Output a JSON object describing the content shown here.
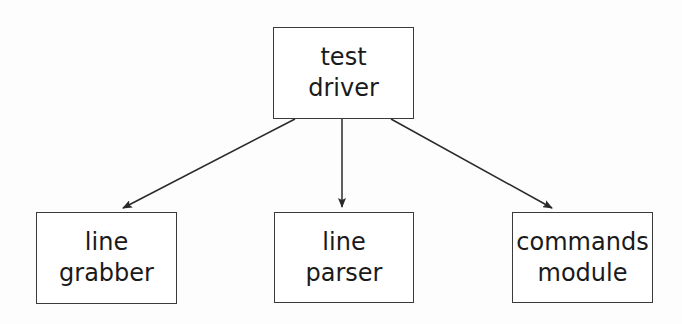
{
  "diagram": {
    "type": "hierarchy",
    "nodes": [
      {
        "id": "test-driver",
        "lines": [
          "test",
          "driver"
        ],
        "box": {
          "x": 273,
          "y": 27,
          "w": 141,
          "h": 92
        }
      },
      {
        "id": "line-grabber",
        "lines": [
          "line",
          "grabber"
        ],
        "box": {
          "x": 36,
          "y": 212,
          "w": 141,
          "h": 92
        }
      },
      {
        "id": "line-parser",
        "lines": [
          "line",
          "parser"
        ],
        "box": {
          "x": 274,
          "y": 212,
          "w": 140,
          "h": 91
        }
      },
      {
        "id": "commands-module",
        "lines": [
          "commands",
          "module"
        ],
        "box": {
          "x": 512,
          "y": 212,
          "w": 141,
          "h": 91
        }
      }
    ],
    "edges": [
      {
        "from": "test-driver",
        "to": "line-grabber",
        "x1": 295,
        "y1": 119,
        "x2": 123,
        "y2": 208
      },
      {
        "from": "test-driver",
        "to": "line-parser",
        "x1": 342,
        "y1": 119,
        "x2": 342,
        "y2": 207
      },
      {
        "from": "test-driver",
        "to": "commands-module",
        "x1": 391,
        "y1": 119,
        "x2": 552,
        "y2": 208
      }
    ],
    "colors": {
      "stroke": "#2a2a2a",
      "background": "#fdfdfd"
    }
  }
}
